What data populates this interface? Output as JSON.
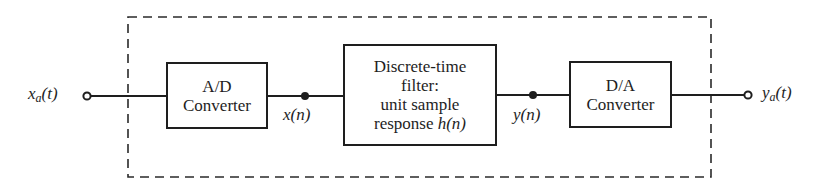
{
  "diagram": {
    "type": "block-diagram",
    "input": {
      "label_var": "x",
      "label_sub": "a",
      "label_arg": "(t)",
      "full": "x_a(t)"
    },
    "output": {
      "label_var": "y",
      "label_sub": "a",
      "label_arg": "(t)",
      "full": "y_a(t)"
    },
    "blocks": [
      {
        "id": "ad",
        "lines": [
          "A/D",
          "Converter"
        ]
      },
      {
        "id": "filter",
        "lines": [
          "Discrete-time",
          "filter:",
          "unit sample",
          "response"
        ],
        "last_line_math": "h(n)"
      },
      {
        "id": "da",
        "lines": [
          "D/A",
          "Converter"
        ]
      }
    ],
    "signals": [
      {
        "id": "x_n",
        "label": "x(n)"
      },
      {
        "id": "y_n",
        "label": "y(n)"
      }
    ],
    "enclosure": {
      "style": "dashed"
    },
    "colors": {
      "stroke": "#1e1e1e",
      "background": "#ffffff"
    }
  }
}
